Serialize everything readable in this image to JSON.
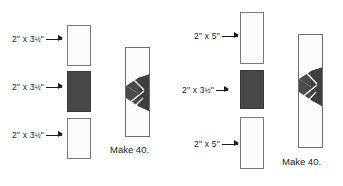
{
  "diagram": {
    "colors": {
      "dark_fabric": "#474747",
      "light_fabric": "#fbfbfa",
      "outline": "#6e6e6e",
      "text": "#1b1b1b",
      "background": "#ffffff"
    },
    "panels": [
      {
        "id": "panel-left",
        "strips": [
          {
            "label_whole": "2\" x 3",
            "label_frac": "½",
            "label_suffix": "\"",
            "label_full": "2\" x 3½\"",
            "fabric": "light"
          },
          {
            "label_whole": "2\" x 3",
            "label_frac": "½",
            "label_suffix": "\"",
            "label_full": "2\" x 3½\"",
            "fabric": "dark"
          },
          {
            "label_whole": "2\" x 3",
            "label_frac": "½",
            "label_suffix": "\"",
            "label_full": "2\" x 3½\"",
            "fabric": "light"
          }
        ],
        "block": {
          "caption": "Make 40.",
          "motif": "hourglass-bowtie-with-stitch-lines"
        }
      },
      {
        "id": "panel-right",
        "strips": [
          {
            "label_whole": "2\" x 5",
            "label_frac": "",
            "label_suffix": "\"",
            "label_full": "2\" x 5\"",
            "fabric": "light"
          },
          {
            "label_whole": "2\" x 3",
            "label_frac": "½",
            "label_suffix": "\"",
            "label_full": "2\" x 3½\"",
            "fabric": "dark"
          },
          {
            "label_whole": "2\" x 5",
            "label_frac": "",
            "label_suffix": "\"",
            "label_full": "2\" x 5\"",
            "fabric": "light"
          }
        ],
        "block": {
          "caption": "Make 40.",
          "motif": "hourglass-bowtie-with-stitch-lines"
        }
      }
    ]
  }
}
